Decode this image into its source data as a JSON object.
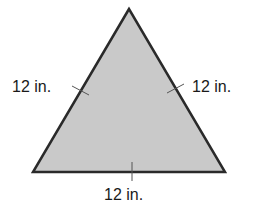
{
  "figure": {
    "shape": "equilateral-triangle",
    "fill_color": "#c9c9c9",
    "stroke_color": "#2a2a2a",
    "sides": [
      {
        "name": "left",
        "label": "12 in."
      },
      {
        "name": "right",
        "label": "12 in."
      },
      {
        "name": "bottom",
        "label": "12 in."
      }
    ]
  }
}
